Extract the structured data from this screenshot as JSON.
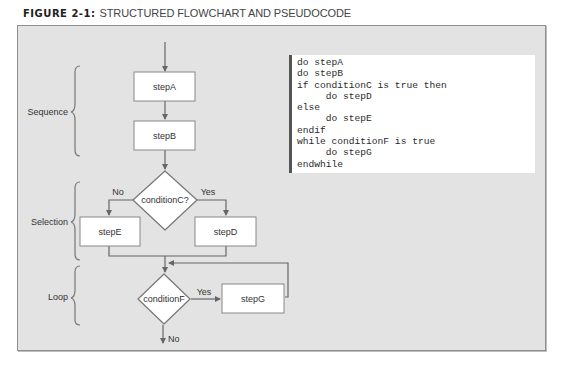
{
  "figure": {
    "number_label": "FIGURE 2-1:",
    "caption": "STRUCTURED FLOWCHART AND PSEUDOCODE"
  },
  "structures": [
    {
      "label": "Sequence"
    },
    {
      "label": "Selection"
    },
    {
      "label": "Loop"
    }
  ],
  "flowchart": {
    "stepA": "stepA",
    "stepB": "stepB",
    "conditionC": "conditionC?",
    "stepE": "stepE",
    "stepD": "stepD",
    "conditionF": "conditionF",
    "stepG": "stepG",
    "branch_no_c": "No",
    "branch_yes_c": "Yes",
    "branch_yes_f": "Yes",
    "branch_no_f": "No"
  },
  "pseudocode": {
    "lines": [
      "do stepA",
      "do stepB",
      "if conditionC is true then",
      "     do stepD",
      "else",
      "     do stepE",
      "endif",
      "while conditionF is true",
      "     do stepG",
      "endwhile"
    ]
  },
  "colors": {
    "panel_bg": "#e3e3e3",
    "line": "#666666",
    "box_fill": "#ffffff",
    "code_bar": "#555555"
  }
}
